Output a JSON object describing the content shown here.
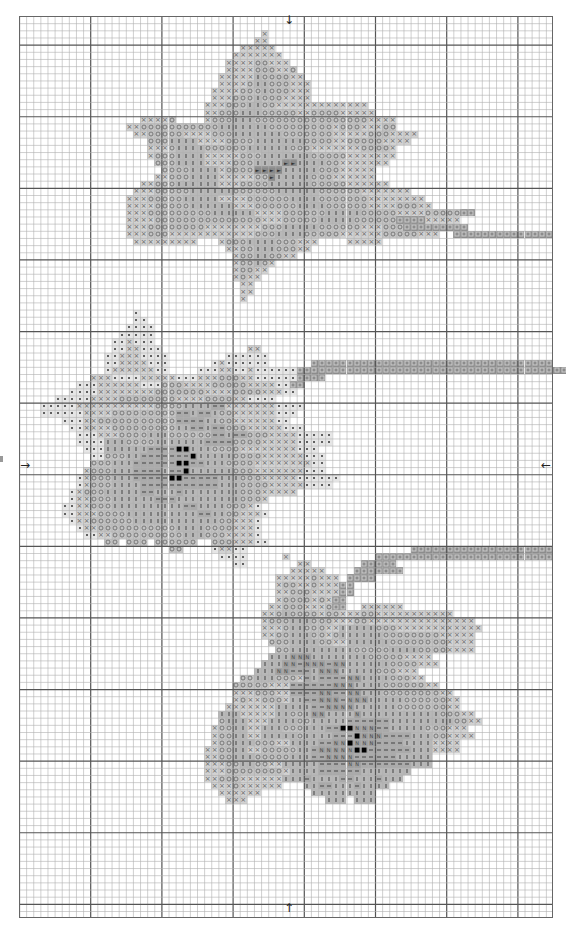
{
  "chart_data": {
    "type": "table",
    "title": "",
    "grid": {
      "cols": 75,
      "rows": 126,
      "cell_w": 7.12,
      "cell_h": 7.16,
      "major_every": 10,
      "major_col_offset": 10,
      "major_row_offset": 4
    },
    "center_arrows": {
      "top": "↓",
      "bottom": "↑",
      "left": "→",
      "right": "←"
    },
    "legend_symbols": {
      "x": "cross",
      "o": "circle",
      "i": "vertical-bar",
      "d": "dash",
      "N": "letter-N",
      "p": "dot",
      "b": "solid-black-square",
      "s": "stem-square",
      "h": "arrow-head"
    },
    "colors": {
      "grid_minor": "#b0b0b0",
      "grid_major": "#555555",
      "border": "#666666"
    },
    "runs": [
      [
        2,
        34,
        "x"
      ],
      [
        3,
        33,
        "xx"
      ],
      [
        4,
        31,
        "xxxxx"
      ],
      [
        5,
        30,
        "xxxxxxx"
      ],
      [
        6,
        29,
        "xxxxooxxx"
      ],
      [
        7,
        29,
        "xxxxoooxxo"
      ],
      [
        8,
        28,
        "xxxxxiooooxx"
      ],
      [
        9,
        28,
        "xxxxoiioooxxx"
      ],
      [
        10,
        27,
        "xxxxoooioooxxx"
      ],
      [
        11,
        27,
        "xxxoooioooxxxx"
      ],
      [
        12,
        26,
        "xxxoooiiooxxxxxxxxxxxxx"
      ],
      [
        13,
        26,
        "xxoooiiioooooxxooooxxxxx"
      ],
      [
        14,
        17,
        "xxxxo"
      ],
      [
        14,
        26,
        "xoooiiiooooooooooooooooxxxx"
      ],
      [
        15,
        15,
        "xxoooooooooooiiiiiiioooooooooxoooxxxoo"
      ],
      [
        16,
        16,
        "xxoooooxxxxoooiiiiiiioooooooxxxxxoooxxxx"
      ],
      [
        17,
        18,
        "oooiiiixxxxooooiiiiiiiooooxxoooooxxxx"
      ],
      [
        18,
        18,
        "xxxoiiiiooooooiiiiiioooxxxxxxxoooox"
      ],
      [
        19,
        18,
        "xoooiiiixxxxxoooiiiiiiioooooxxxxxxx"
      ],
      [
        20,
        19,
        "oooiiiixxxxoooiiiihhiiiiooxxxxxxx"
      ],
      [
        21,
        20,
        "ooooiiiixoooohhhhiiiiioooxxxxx"
      ],
      [
        22,
        19,
        "xxoooiiiixxxxxoohiiiiioooxxxxxx"
      ],
      [
        23,
        17,
        "xxoooiiiiiixxxooooiiiiiioooooxxxxxx"
      ],
      [
        24,
        16,
        "xxxoooooiiiiiiooooooiiiiiiooooooxxxxxxx"
      ],
      [
        25,
        15,
        "xxxoooooiiiiixxxxooooooiiiioooooooxxxxxxxx"
      ],
      [
        26,
        15,
        "xxxxoooooiiiiiixxxooooooiiiiooooooxxxxoooxx"
      ],
      [
        27,
        15,
        "xxxoooooooooiiiiiixxxxooooooiiiiioooooxxxxoooooss"
      ],
      [
        28,
        15,
        "xxxxoooooooooooooooxxxoooooiiiiiooooooxxxxxxxxx"
      ],
      [
        28,
        53,
        "ssss"
      ],
      [
        29,
        15,
        "xxxooooooooxxxxxxxxoooiiiiiooooooxxxoooxxxxxxx"
      ],
      [
        29,
        54,
        "sssssssss"
      ],
      [
        30,
        15,
        "xxxoooxxxxxxxxxxxxoooiiiioooooxxxxxxoooooxxx"
      ],
      [
        30,
        61,
        "ssssssssssssss"
      ],
      [
        31,
        16,
        "xxxxxxxxx"
      ],
      [
        31,
        28,
        "xoooiiiioooxxx"
      ],
      [
        31,
        46,
        "xxxxx"
      ],
      [
        32,
        29,
        "xxooiiioooxx"
      ],
      [
        33,
        30,
        "xooiiooxx"
      ],
      [
        34,
        30,
        "xooiox"
      ],
      [
        35,
        30,
        "xooxx"
      ],
      [
        36,
        30,
        "xoxx"
      ],
      [
        37,
        31,
        "xx"
      ],
      [
        38,
        31,
        "xx"
      ],
      [
        39,
        31,
        "x"
      ],
      [
        41,
        16,
        "p"
      ],
      [
        42,
        16,
        "pp"
      ],
      [
        43,
        15,
        "pppp"
      ],
      [
        44,
        14,
        "ppppp"
      ],
      [
        45,
        13,
        "ppxppp"
      ],
      [
        46,
        13,
        "ppxxppp"
      ],
      [
        46,
        32,
        "xx"
      ],
      [
        47,
        12,
        "ppxxxpppp"
      ],
      [
        47,
        29,
        "pppppp"
      ],
      [
        48,
        12,
        "ppxxxxppp"
      ],
      [
        48,
        27,
        "pxpppppp"
      ],
      [
        48,
        41,
        "ssssssssssssssssssssssssssssssssss"
      ],
      [
        49,
        12,
        "pxxxxxxpp"
      ],
      [
        49,
        25,
        "pppxxppxpppp"
      ],
      [
        49,
        37,
        "pp"
      ],
      [
        49,
        39,
        "ssssssssssssssssssssssssssssssssssssss"
      ],
      [
        50,
        10,
        "xxxppppxxxxxpppxxxoooxxpppppp"
      ],
      [
        50,
        39,
        "ssss"
      ],
      [
        51,
        8,
        "pppxxxxxxpppoooxxxxoooooxxxxpp"
      ],
      [
        51,
        38,
        "ss"
      ],
      [
        52,
        7,
        "ppppxxxxxxxxoooooooxxxxooooxxxpp"
      ],
      [
        53,
        5,
        "pppppxxxxooooooooxxxxooooxxpppp"
      ],
      [
        54,
        3,
        "pppppxxxxxxxxxxxooooiiiiddxxxxxxxpppp"
      ],
      [
        55,
        3,
        "ppppppxxxxoooooooooddiddiooxxxxxxppp"
      ],
      [
        56,
        6,
        "pppxxoooooooooooddddiiooxxxxxxpp"
      ],
      [
        57,
        7,
        "ppxxxxoooooooooiiddiddoooxxxxxppp"
      ],
      [
        58,
        8,
        "pppxxxooooiiiooooooddiddoooxxxxppppp"
      ],
      [
        59,
        8,
        "ppppiiiooooiiiiiiiddddooooxxxxxppppp"
      ],
      [
        60,
        9,
        "pppiiiiiiddddbbiiiooooxxxxxxxxppp"
      ],
      [
        61,
        10,
        "ppoooiidddddddbiiiiiooooxxxxxxppp"
      ],
      [
        62,
        10,
        "oooiiiddddddbbddiiiooooxxxxxxxxpp"
      ],
      [
        63,
        9,
        "xoooiiiddddiddbiiiiiioooxxxxxxxppp"
      ],
      [
        64,
        8,
        "pxoooiiidddddbbdddddiiioooxxxxxpppppp"
      ],
      [
        65,
        8,
        "pxoooiiiidddddddddddiiiooooxxxxxpppp"
      ],
      [
        66,
        7,
        "pxoooiiiiiddiiidiiiiiiiioooxxxxx"
      ],
      [
        67,
        7,
        "pxxoooiiiiiidddiiiiiiiiiooox"
      ],
      [
        68,
        6,
        "ppxxoooiiiiiiiiiiddiiiioooxp"
      ],
      [
        69,
        6,
        "ppxxxooooiiiiiiiiiiddiiooxxxp"
      ],
      [
        70,
        7,
        "pxxooooooiiiiiiiiiiiiooxxxp"
      ],
      [
        71,
        8,
        "pxxoooooooooooiiiiooooxxxp"
      ],
      [
        72,
        9,
        "ppxxooooooooooiiioooxxxxp"
      ],
      [
        73,
        12,
        "oo"
      ],
      [
        73,
        15,
        "ooo"
      ],
      [
        73,
        19,
        "oooooo"
      ],
      [
        73,
        27,
        "oooxxxpp"
      ],
      [
        74,
        21,
        "oo"
      ],
      [
        74,
        27,
        "pxxpp"
      ],
      [
        74,
        55,
        "ssssssssssssssssssss"
      ],
      [
        75,
        28,
        "pppp"
      ],
      [
        75,
        37,
        "x"
      ],
      [
        75,
        50,
        "sssssssssssssssssssssssss"
      ],
      [
        76,
        30,
        "pp"
      ],
      [
        76,
        39,
        "xx"
      ],
      [
        76,
        48,
        "sssss"
      ],
      [
        77,
        38,
        "xxxxx"
      ],
      [
        77,
        47,
        "sssssss"
      ],
      [
        78,
        36,
        "xxxxxoxxx"
      ],
      [
        78,
        46,
        "ss"
      ],
      [
        78,
        48,
        "ss"
      ],
      [
        79,
        36,
        "xooxxoxxx"
      ],
      [
        79,
        45,
        "ss"
      ],
      [
        80,
        36,
        "xxoooxxxxx"
      ],
      [
        80,
        45,
        "ss"
      ],
      [
        81,
        36,
        "xooooxoxx"
      ],
      [
        81,
        44,
        "ss"
      ],
      [
        82,
        35,
        "xxoooxxxoxx"
      ],
      [
        82,
        44,
        "ss"
      ],
      [
        82,
        48,
        "xxxxxx"
      ],
      [
        83,
        34,
        "xxoiooooxooxx"
      ],
      [
        83,
        47,
        "xooxxxxxxxxxxx"
      ],
      [
        84,
        34,
        "xoooiiioooxxxooxxxxxxxxxxxxxxx"
      ],
      [
        85,
        34,
        "xxxoiioooxxiiiiioooxxxxxxxxxxxx"
      ],
      [
        86,
        34,
        "xxooiiiooxoiiiiiiooooooooxxxxx"
      ],
      [
        87,
        35,
        "oooiiiiooxxiiiiiiooooooooxxxx"
      ],
      [
        88,
        36,
        "ooiiiiiiiiioooooiiiiooooxxxx"
      ],
      [
        89,
        35,
        "iiiNNNiiiiiiiioooooxxxx"
      ],
      [
        90,
        34,
        "iiiNNdNNNdNNiiiiiiooooxxx"
      ],
      [
        91,
        33,
        "iiiNNdddiNNNiiiiioooxxx"
      ],
      [
        92,
        31,
        "ooiiioooxdiddddNNiiiioooxx"
      ],
      [
        93,
        30,
        "oooooxxxddddddNNNiiiiooooooxx"
      ],
      [
        94,
        30,
        "xxxoooxxddddNNddNNiiiooooooooxx"
      ],
      [
        95,
        30,
        "xoxxoooxiiddNNNdNNNiiiiiooooooxx"
      ],
      [
        96,
        29,
        "xxxxxxxiiiiiddNNNNiiiiiioooooooxx"
      ],
      [
        97,
        28,
        "iiixxxxxiiooiNNiiiiNiiiiiiiiiiioooxx"
      ],
      [
        98,
        28,
        "oiiixxxiiiiooiiiiiddddddiiiiiiiiiooxx"
      ],
      [
        99,
        27,
        "xooiixxiiioooiiiddbbNNNddiiiiioooxxx"
      ],
      [
        100,
        27,
        "xooiixxiiiiioiiiidddbNNNddddiiiooxxxx"
      ],
      [
        101,
        27,
        "xooiiioooxxiiiiddNNbNNNddddiiiixxxx"
      ],
      [
        102,
        26,
        "xxooiixxoooooiidNNNNNbbddddddiiixxxx"
      ],
      [
        103,
        26,
        "xxooiiioooooiiiddNNNNddddddiiiii"
      ],
      [
        104,
        26,
        "xxxooiiooxxiiiiiddddNNdddddddiii"
      ],
      [
        105,
        26,
        "xxxooooooooxiiiiddddddiiiiiii"
      ],
      [
        106,
        26,
        "xxoooxxxxxxiiidiiiiddiiidiii"
      ],
      [
        107,
        27,
        "xxxoxxxxxx"
      ],
      [
        107,
        40,
        "iiddiiidiiii"
      ],
      [
        108,
        28,
        "xxxxxx"
      ],
      [
        108,
        41,
        "iiiiiiiii"
      ],
      [
        109,
        29,
        "xxx"
      ],
      [
        109,
        43,
        "iii"
      ],
      [
        109,
        47,
        "iii"
      ]
    ]
  }
}
